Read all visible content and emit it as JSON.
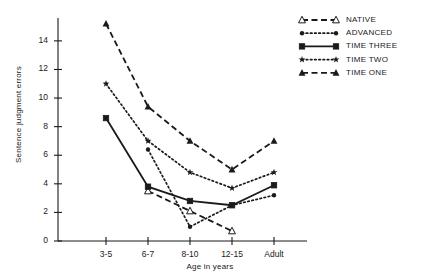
{
  "chart_data": {
    "type": "line",
    "title": "",
    "xlabel": "Age in years",
    "ylabel": "Sentence judgment errors",
    "categories": [
      "3-5",
      "6-7",
      "8-10",
      "12-15",
      "Adult"
    ],
    "yticks": [
      0,
      2,
      4,
      6,
      8,
      10,
      12,
      14
    ],
    "ylim": [
      0,
      15.6
    ],
    "grid": false,
    "legend_position": "top-right",
    "series": [
      {
        "name": "NATIVE",
        "marker": "triangle-open",
        "line": "dashed",
        "x": [
          "6-7",
          "8-10",
          "12-15"
        ],
        "values": [
          3.5,
          2.1,
          0.7
        ]
      },
      {
        "name": "ADVANCED",
        "marker": "circle",
        "line": "dotted",
        "x": [
          "6-7",
          "8-10",
          "12-15",
          "Adult"
        ],
        "values": [
          6.4,
          1.0,
          2.5,
          3.2
        ]
      },
      {
        "name": "TIME THREE",
        "marker": "square",
        "line": "solid",
        "x": [
          "3-5",
          "6-7",
          "8-10",
          "12-15",
          "Adult"
        ],
        "values": [
          8.6,
          3.8,
          2.8,
          2.5,
          3.9
        ]
      },
      {
        "name": "TIME TWO",
        "marker": "star",
        "line": "dotted",
        "x": [
          "3-5",
          "6-7",
          "8-10",
          "12-15",
          "Adult"
        ],
        "values": [
          11.0,
          7.0,
          4.8,
          3.7,
          4.8
        ]
      },
      {
        "name": "TIME ONE",
        "marker": "triangle-filled",
        "line": "dashed",
        "x": [
          "3-5",
          "6-7",
          "8-10",
          "12-15",
          "Adult"
        ],
        "values": [
          15.2,
          9.4,
          7.0,
          5.0,
          7.0
        ]
      }
    ]
  },
  "axes": {
    "y_title": "Sentence judgment errors",
    "x_title": "Age in years",
    "y_tick_labels": [
      "14",
      "12",
      "10",
      "8",
      "6",
      "4",
      "2",
      "0"
    ],
    "x_tick_labels": [
      "3-5",
      "6-7",
      "8-10",
      "12-15",
      "Adult"
    ]
  },
  "legend": {
    "entries": [
      {
        "label": "NATIVE"
      },
      {
        "label": "ADVANCED"
      },
      {
        "label": "TIME THREE"
      },
      {
        "label": "TIME TWO"
      },
      {
        "label": "TIME ONE"
      }
    ]
  },
  "colors": {
    "ink": "#1a1a1a",
    "background": "#ffffff"
  }
}
